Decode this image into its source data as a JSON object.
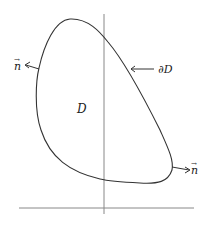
{
  "figure": {
    "region_label": "D",
    "boundary_label": "∂D",
    "normal_label_left": "n",
    "normal_label_right": "n",
    "normal_vector_arrow": "→",
    "colors": {
      "curve": "#333333",
      "axes": "#888888",
      "text": "#222222",
      "background": "#ffffff"
    }
  }
}
